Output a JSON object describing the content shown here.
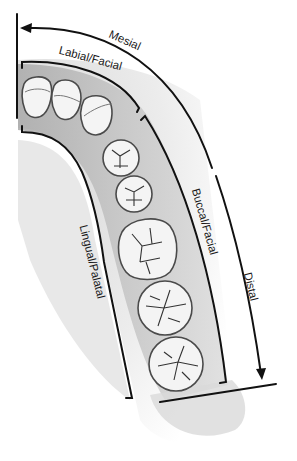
{
  "figure": {
    "labels": {
      "mesial": "Mesial",
      "distal": "Distal",
      "labial_facial": "Labial/Facial",
      "buccal_facial": "Buccal/Facial",
      "lingual_palatal": "Lingual/Palatal"
    },
    "teeth": [
      {
        "name": "central-incisor"
      },
      {
        "name": "lateral-incisor"
      },
      {
        "name": "canine"
      },
      {
        "name": "first-premolar"
      },
      {
        "name": "second-premolar"
      },
      {
        "name": "first-molar"
      },
      {
        "name": "second-molar"
      },
      {
        "name": "third-molar"
      }
    ],
    "colors": {
      "line": "#111111",
      "gum": "#b9b9b9",
      "palate": "#e4e4e4",
      "tooth": "#f4f4f4",
      "tooth_outline": "#4a4a4a"
    }
  }
}
